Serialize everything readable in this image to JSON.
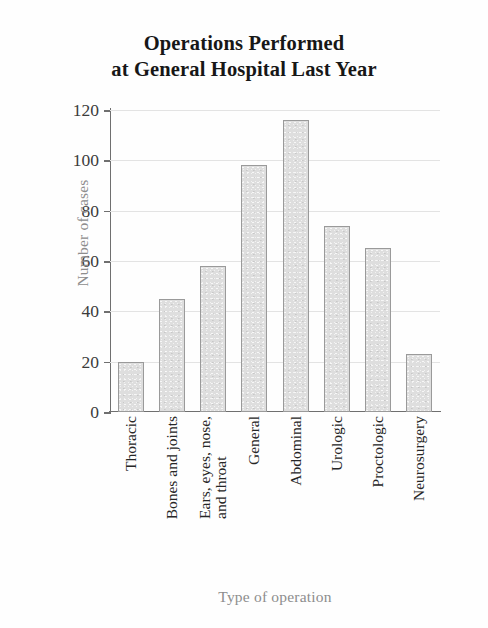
{
  "chart_data": {
    "type": "bar",
    "title": "Operations Performed at General Hospital Last Year",
    "title_lines": [
      "Operations Performed",
      "at General Hospital Last Year"
    ],
    "xlabel": "Type of operation",
    "ylabel": "Number of cases",
    "categories": [
      "Thoracic",
      "Bones and joints",
      "Ears, eyes, nose, and throat",
      "General",
      "Abdominal",
      "Urologic",
      "Proctologic",
      "Neurosurgery"
    ],
    "category_label_lines": [
      [
        "Thoracic"
      ],
      [
        "Bones and joints"
      ],
      [
        "Ears, eyes, nose,",
        "and throat"
      ],
      [
        "General"
      ],
      [
        "Abdominal"
      ],
      [
        "Urologic"
      ],
      [
        "Proctologic"
      ],
      [
        "Neurosurgery"
      ]
    ],
    "values": [
      20,
      45,
      58,
      98,
      116,
      74,
      65,
      23
    ],
    "ylim": [
      0,
      120
    ],
    "yticks": [
      0,
      20,
      40,
      60,
      80,
      100,
      120
    ],
    "ytick_labels": [
      "0",
      "20",
      "40",
      "60",
      "80",
      "100",
      "120"
    ],
    "grid": true,
    "legend": false,
    "bar_fill_color": "#dedede",
    "bar_edge_color": "#9a9a9a",
    "grid_color": "#e3e3e3",
    "axis_color": "#6f6f6f",
    "title_color": "#171717",
    "axis_title_color": "#8d8d8d",
    "tick_label_color": "#3b3b3b"
  }
}
